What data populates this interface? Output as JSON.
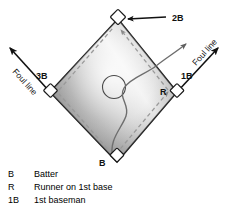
{
  "figure": {
    "field_labels": {
      "second_base": "2B",
      "third_base": "3B",
      "first_base": "1B",
      "batter": "B",
      "runner": "R",
      "foul_line_left": "Foul line",
      "foul_line_right": "Foul line"
    },
    "colors": {
      "infield_light": "#f2f2f2",
      "infield_mid": "#b9b9b9",
      "infield_dark": "#8f8f8f",
      "outline": "#1a1a1a",
      "base_fill": "#ffffff",
      "dashed_path": "#9a9a9a",
      "runner_path": "#6e6e6e"
    },
    "elements": {
      "mound_shape": "circle-outline",
      "base_shape": "small-square",
      "home_plate_shape": "small-square",
      "base_path_style": "dashed-with-arrowheads",
      "runner_path_style": "solid-wavy-with-arrowhead"
    }
  },
  "legend": {
    "rows": [
      {
        "key": "B",
        "description": "Batter"
      },
      {
        "key": "R",
        "description": "Runner on 1st base"
      },
      {
        "key": "1B",
        "description": "1st baseman"
      }
    ]
  }
}
